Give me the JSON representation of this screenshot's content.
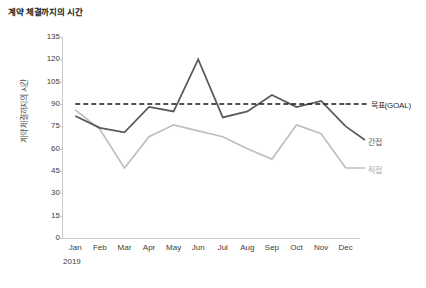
{
  "chart_data": {
    "type": "line",
    "title": "계약 체결까지의 시간",
    "xlabel": "2019",
    "ylabel": "계약 체결까지의 시간",
    "categories": [
      "Jan",
      "Feb",
      "Mar",
      "Apr",
      "May",
      "Jun",
      "Jul",
      "Aug",
      "Sep",
      "Oct",
      "Nov",
      "Dec"
    ],
    "yticks": [
      135,
      120,
      105,
      90,
      75,
      60,
      45,
      30,
      15,
      0
    ],
    "ylim": [
      0,
      135
    ],
    "grid": false,
    "legend_position": "right",
    "series": [
      {
        "name": "간접",
        "style": "solid",
        "color": "#595959",
        "values": [
          82,
          74,
          71,
          88,
          85,
          120,
          81,
          85,
          96,
          88,
          92,
          75
        ]
      },
      {
        "name": "직접",
        "style": "solid",
        "color": "#bfbfbf",
        "values": [
          86,
          73,
          47,
          68,
          76,
          72,
          68,
          60,
          53,
          76,
          70,
          47
        ]
      },
      {
        "name": "목표(GOAL)",
        "style": "dashed",
        "color": "#1a1a1a",
        "values": [
          90,
          90,
          90,
          90,
          90,
          90,
          90,
          90,
          90,
          90,
          90,
          90
        ]
      }
    ],
    "annotations": {
      "year": "2019"
    }
  },
  "legend": {
    "goal": "목표(GOAL)",
    "indirect": "간접",
    "direct": "직접"
  },
  "caption": ""
}
